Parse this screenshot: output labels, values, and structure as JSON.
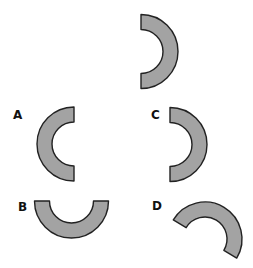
{
  "puzzle": {
    "description": "Which option is the same half-ring shape as the one shown at the top?",
    "reference_shape": {
      "name": "half-ring",
      "orientation": "opening-left, arc-right",
      "fill_color": "#a3a3a3",
      "stroke_color": "#222222"
    },
    "options": [
      {
        "label": "A",
        "orientation": "arc-left, opening-right"
      },
      {
        "label": "B",
        "orientation": "arc-bottom, opening-up"
      },
      {
        "label": "C",
        "orientation": "arc-right, opening-left"
      },
      {
        "label": "D",
        "orientation": "rotated, arc-upper-right"
      }
    ]
  }
}
